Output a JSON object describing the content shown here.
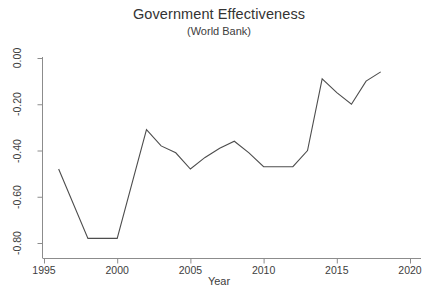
{
  "chart_data": {
    "type": "line",
    "title": "Government Effectiveness",
    "subtitle": "(World Bank)",
    "xlabel": "Year",
    "ylabel": "",
    "xlim": [
      1995,
      2020
    ],
    "ylim": [
      -0.86,
      0.02
    ],
    "grid": false,
    "legend": null,
    "xticks": [
      "1995",
      "2000",
      "2005",
      "2010",
      "2015",
      "2020"
    ],
    "xtick_values": [
      1995,
      2000,
      2005,
      2010,
      2015,
      2020
    ],
    "yticks": [
      "0.00",
      "-0.20",
      "-0.40",
      "-0.60",
      "-0.80"
    ],
    "ytick_values": [
      0.0,
      -0.2,
      -0.4,
      -0.6,
      -0.8
    ],
    "line_color": "#4d4d4d",
    "x": [
      1996,
      1998,
      2000,
      2002,
      2003,
      2004,
      2005,
      2006,
      2007,
      2008,
      2009,
      2010,
      2011,
      2012,
      2013,
      2014,
      2015,
      2016,
      2017,
      2018
    ],
    "values": [
      -0.48,
      -0.78,
      -0.78,
      -0.31,
      -0.38,
      -0.41,
      -0.48,
      -0.43,
      -0.39,
      -0.36,
      -0.41,
      -0.47,
      -0.47,
      -0.47,
      -0.4,
      -0.09,
      -0.15,
      -0.2,
      -0.1,
      -0.06
    ],
    "series": [
      {
        "name": "Government Effectiveness",
        "values": [
          -0.48,
          -0.78,
          -0.78,
          -0.31,
          -0.38,
          -0.41,
          -0.48,
          -0.43,
          -0.39,
          -0.36,
          -0.41,
          -0.47,
          -0.47,
          -0.47,
          -0.4,
          -0.09,
          -0.15,
          -0.2,
          -0.1,
          -0.06
        ]
      }
    ]
  },
  "axes": {
    "y_tick_labels": [
      "0.00",
      "-0.20",
      "-0.40",
      "-0.60",
      "-0.80"
    ],
    "x_tick_labels": [
      "1995",
      "2000",
      "2005",
      "2010",
      "2015",
      "2020"
    ]
  }
}
